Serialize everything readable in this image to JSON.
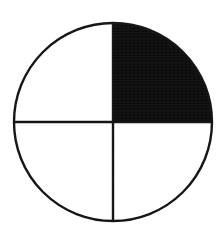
{
  "figure": {
    "name": "fraction-circle",
    "background_color": "#ffffff",
    "stroke_color": "#111111",
    "fill_color": "#0b0b0b",
    "stroke_width": 2.4,
    "center_x": 113,
    "center_y": 122,
    "radius": 99
  },
  "chart_data": {
    "type": "pie",
    "title": "",
    "subtitle": "",
    "xlabel": "",
    "ylabel": "",
    "grid": false,
    "legend_position": "none",
    "total_slices": 4,
    "shaded_slices": 1,
    "fraction_shaded": "1/4",
    "percent_shaded": 25,
    "categories": [
      "upper-right",
      "upper-left",
      "lower-left",
      "lower-right"
    ],
    "values": [
      25,
      25,
      25,
      25
    ],
    "slices": [
      {
        "name": "upper-right",
        "label": "",
        "value": 25,
        "start_angle_deg": 0,
        "end_angle_deg": 90,
        "fill": "#0b0b0b",
        "shaded": true
      },
      {
        "name": "upper-left",
        "label": "",
        "value": 25,
        "start_angle_deg": 90,
        "end_angle_deg": 180,
        "fill": "#ffffff",
        "shaded": false
      },
      {
        "name": "lower-left",
        "label": "",
        "value": 25,
        "start_angle_deg": 180,
        "end_angle_deg": 270,
        "fill": "#ffffff",
        "shaded": false
      },
      {
        "name": "lower-right",
        "label": "",
        "value": 25,
        "start_angle_deg": 270,
        "end_angle_deg": 360,
        "fill": "#ffffff",
        "shaded": false
      }
    ],
    "dividers": [
      {
        "name": "vertical-diameter",
        "x1": 113,
        "y1": 23,
        "x2": 113,
        "y2": 221
      },
      {
        "name": "horizontal-diameter",
        "x1": 14,
        "y1": 122,
        "x2": 212,
        "y2": 122
      }
    ],
    "annotations": []
  }
}
